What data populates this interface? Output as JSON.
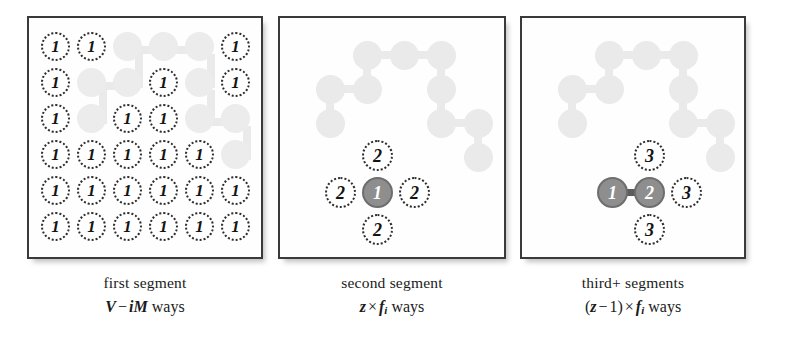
{
  "figure": {
    "colors": {
      "node_fill_dark": "#8e8e8e",
      "node_stroke_dark": "#6e6e6e",
      "ghost": "#eaeaea",
      "panel_border": "#3a3a3a",
      "text": "#141414"
    }
  },
  "panels": [
    {
      "id": "panel-1",
      "name": "first-segment-panel",
      "grid": {
        "rows": 6,
        "cols": 6,
        "cells": [
          [
            "1",
            "1",
            "ghost",
            "ghost",
            "ghost",
            "1"
          ],
          [
            "1",
            "ghost",
            "ghost",
            "1",
            "ghost",
            "1"
          ],
          [
            "1",
            "ghost",
            "1",
            "1",
            "ghost",
            "ghost"
          ],
          [
            "1",
            "1",
            "1",
            "1",
            "1",
            "ghost"
          ],
          [
            "1",
            "1",
            "1",
            "1",
            "1",
            "1"
          ],
          [
            "1",
            "1",
            "1",
            "1",
            "1",
            "1"
          ]
        ]
      },
      "caption": {
        "line1": "first segment",
        "formula": {
          "var1": "V",
          "op": "−",
          "var2": "i",
          "var3": "M",
          "suffix": "ways"
        }
      }
    },
    {
      "id": "panel-2",
      "name": "second-segment-panel",
      "nodes": [
        {
          "label": "2",
          "state": "dotted",
          "position": "top"
        },
        {
          "label": "2",
          "state": "dotted",
          "position": "left"
        },
        {
          "label": "1",
          "state": "filled",
          "position": "center"
        },
        {
          "label": "2",
          "state": "dotted",
          "position": "right"
        },
        {
          "label": "2",
          "state": "dotted",
          "position": "bottom"
        }
      ],
      "caption": {
        "line1": "second segment",
        "formula": {
          "var1": "z",
          "op": "×",
          "var2": "f",
          "sub2": "i",
          "suffix": "ways"
        }
      }
    },
    {
      "id": "panel-3",
      "name": "third-plus-segments-panel",
      "nodes": [
        {
          "label": "3",
          "state": "dotted",
          "position": "top"
        },
        {
          "label": "1",
          "state": "filled",
          "position": "center-left"
        },
        {
          "label": "2",
          "state": "filled",
          "position": "center"
        },
        {
          "label": "3",
          "state": "dotted",
          "position": "right"
        },
        {
          "label": "3",
          "state": "dotted",
          "position": "bottom"
        }
      ],
      "caption": {
        "line1": "third+ segments",
        "formula": {
          "open": "(",
          "var1": "z",
          "op1": "−",
          "num": "1",
          "close": ")",
          "op2": "×",
          "var2": "f",
          "sub2": "i",
          "suffix": "ways"
        }
      }
    }
  ]
}
